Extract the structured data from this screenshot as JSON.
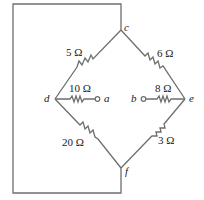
{
  "diagram": {
    "type": "circuit-bridge",
    "stroke_color": "#6e6e6e",
    "nodes": {
      "c": {
        "label": "c"
      },
      "d": {
        "label": "d"
      },
      "e": {
        "label": "e"
      },
      "f": {
        "label": "f"
      },
      "a": {
        "label": "a"
      },
      "b": {
        "label": "b"
      }
    },
    "resistors": [
      {
        "id": "R_cd",
        "from": "c",
        "to": "d",
        "label": "5 Ω"
      },
      {
        "id": "R_ce",
        "from": "c",
        "to": "e",
        "label": "6 Ω"
      },
      {
        "id": "R_da",
        "from": "d",
        "to": "a",
        "label": "10 Ω"
      },
      {
        "id": "R_be",
        "from": "b",
        "to": "e",
        "label": "8 Ω"
      },
      {
        "id": "R_df",
        "from": "d",
        "to": "f",
        "label": "20 Ω"
      },
      {
        "id": "R_ef",
        "from": "e",
        "to": "f",
        "label": "3 Ω"
      }
    ],
    "wires": [
      {
        "id": "loop",
        "description": "short wire from node c around the left side to node f"
      }
    ]
  }
}
